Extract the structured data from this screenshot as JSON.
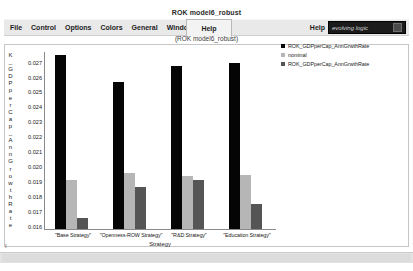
{
  "window": {
    "title": "ROK model6_robust",
    "subtitle": "(ROK model6_robust)"
  },
  "menu": {
    "items": [
      {
        "label": "File"
      },
      {
        "label": "Control"
      },
      {
        "label": "Options"
      },
      {
        "label": "Colors"
      },
      {
        "label": "General"
      },
      {
        "label": "Windows"
      }
    ],
    "help_tab": "Help",
    "right_help": "Help",
    "brand_label": "evolving logic",
    "brand_icon": "window-glyph-icon"
  },
  "status": {
    "corner_mark": "I"
  },
  "chart_data": {
    "type": "bar",
    "title": "",
    "xlabel": "Strategy",
    "ylabel": "K_GDPperCap_AnnGrowthRate",
    "ylim": [
      0.0155,
      0.02745
    ],
    "yticks": [
      0.027,
      0.026,
      0.025,
      0.024,
      0.023,
      0.022,
      0.021,
      0.02,
      0.019,
      0.018,
      0.017,
      0.016
    ],
    "ytick_labels": [
      "0.027",
      "0.026",
      "0.025",
      "0.024",
      "0.023",
      "0.022",
      "0.021",
      "0.020",
      "0.019",
      "0.018",
      "0.017",
      "0.016"
    ],
    "grid": false,
    "legend_position": "right",
    "categories": [
      "\"Base Strategy\"",
      "\"Openness-ROW Strategy\"",
      "\"R&D Strategy\"",
      "\"Education Strategy\""
    ],
    "series": [
      {
        "name": "ROK_GDPperCap_AnnGrwthRate",
        "color": "#050505",
        "values": [
          0.02715,
          0.02535,
          0.02645,
          0.02665
        ]
      },
      {
        "name": "nominal",
        "color": "#b6b6b6",
        "values": [
          0.0188,
          0.01925,
          0.01905,
          0.01915
        ]
      },
      {
        "name": "ROK_GDPperCap_AnnGrwthRate",
        "color": "#555555",
        "values": [
          0.01625,
          0.01835,
          0.0188,
          0.0172
        ]
      }
    ]
  }
}
